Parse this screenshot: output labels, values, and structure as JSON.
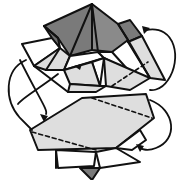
{
  "diagram": {
    "type": "origami-fold-step",
    "colors": {
      "background": "#ffffff",
      "stroke": "#111111",
      "dark_fill": "#7a7a7a",
      "light_fill": "#dedede",
      "white_fill": "#ffffff"
    },
    "elements": {
      "top_pyramid": "dark gray pyramid with apex at top center",
      "middle_flaps": "light gray and white triangular flaps around the pyramid base",
      "lower_panel": "light gray hexagonal panel with two dashed fold lines",
      "bottom_point": "small dark gray point below the panel",
      "arrows": [
        "curved arrow left side",
        "curved arrow right side"
      ]
    }
  }
}
